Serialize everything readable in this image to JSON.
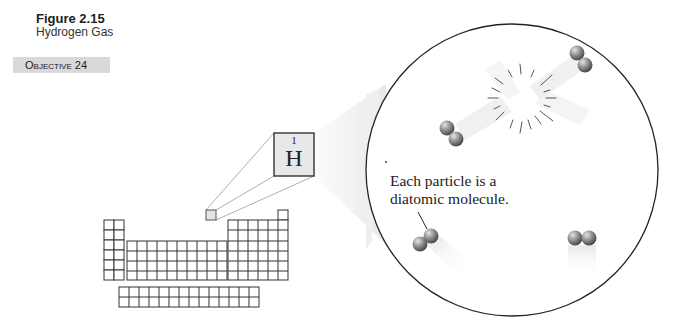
{
  "figure": {
    "number": "Figure 2.15",
    "title": "Hydrogen Gas",
    "objective_label": "Objective",
    "objective_number": "24"
  },
  "element_box": {
    "atomic_number": "1",
    "symbol": "H"
  },
  "callout": {
    "line1": "Each particle is a",
    "line2": "diatomic molecule."
  },
  "periodic_table": {
    "main_rows": 7,
    "columns": 18,
    "f_block_rows": 2,
    "f_block_columns": 14,
    "highlighted_element": "H"
  },
  "molecules": [
    {
      "name": "H2",
      "position": "top-right"
    },
    {
      "name": "H2",
      "position": "middle-left"
    },
    {
      "name": "H2",
      "position": "bottom-left"
    },
    {
      "name": "H2",
      "position": "bottom-right"
    }
  ],
  "colors": {
    "objective_bg": "#d9d9d9",
    "outline": "#333333",
    "element_box_bg": "#e8e8e8",
    "atom_gray": "#8a8a8a"
  }
}
